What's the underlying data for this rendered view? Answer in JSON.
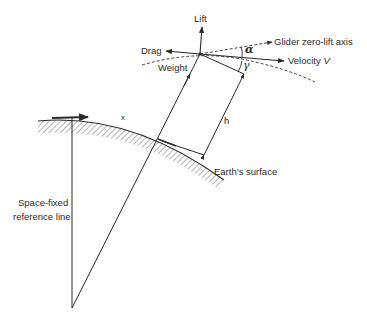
{
  "figure": {
    "labels": {
      "lift": "Lift",
      "drag": "Drag",
      "weight": "Weight",
      "zero_lift_axis": "Glider zero-lift axis",
      "velocity": "Velocity",
      "velocity_symbol": "V",
      "alpha": "α",
      "gamma": "γ",
      "h": "h",
      "x": "x",
      "earth_surface": "Earth’s surface",
      "reference_line_1": "Space-fixed",
      "reference_line_2": "reference line"
    },
    "colors": {
      "line": "#2a2a2a",
      "hatch": "#6a6a6a",
      "background": "#ffffff"
    }
  }
}
